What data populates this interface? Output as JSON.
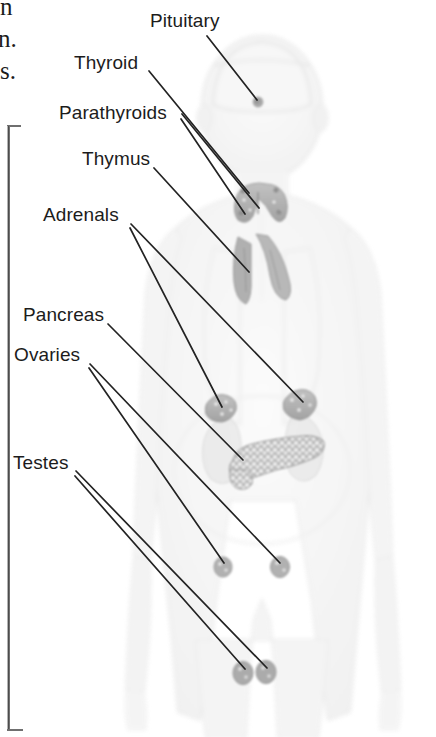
{
  "figure": {
    "type": "labelled-anatomical-diagram",
    "width": 436,
    "height": 737,
    "background_color": "#ffffff",
    "label_color": "#1c1c1c",
    "leader_line_color": "#232323",
    "organ_fill_color": "#b4b4b4",
    "body_silhouette_color": "#f2f2f2"
  },
  "page_text_fragments": [
    {
      "text": "n",
      "x": 0,
      "y": 2
    },
    {
      "text": "n.",
      "x": 0,
      "y": 30
    },
    {
      "text": "s.",
      "x": 2,
      "y": 60
    }
  ],
  "labels": [
    {
      "name": "pituitary",
      "text": "Pituitary",
      "x": 150,
      "y": 11,
      "leader": {
        "x1": 207,
        "y1": 36,
        "x2": 257,
        "y2": 100
      },
      "target": {
        "x": 258,
        "y": 102
      }
    },
    {
      "name": "thyroid",
      "text": "Thyroid",
      "x": 74,
      "y": 53,
      "leader": {
        "x1": 149,
        "y1": 71,
        "x2": 248,
        "y2": 192
      },
      "target": {
        "x": 250,
        "y": 194
      }
    },
    {
      "name": "parathyroids",
      "text": "Parathyroids",
      "x": 59,
      "y": 103,
      "leader": {
        "x1": 182,
        "y1": 115,
        "x2": 258,
        "y2": 209
      },
      "leader2": {
        "x1": 182,
        "y1": 118,
        "x2": 245,
        "y2": 215
      },
      "target": {
        "x": 258,
        "y": 209
      }
    },
    {
      "name": "thymus",
      "text": "Thymus",
      "x": 82,
      "y": 149,
      "leader": {
        "x1": 154,
        "y1": 168,
        "x2": 248,
        "y2": 271
      },
      "target": {
        "x": 250,
        "y": 273
      }
    },
    {
      "name": "adrenals",
      "text": "Adrenals",
      "x": 43,
      "y": 205,
      "leader": {
        "x1": 131,
        "y1": 225,
        "x2": 303,
        "y2": 404
      },
      "leader2": {
        "x1": 131,
        "y1": 227,
        "x2": 222,
        "y2": 409
      },
      "target": {
        "x": 303,
        "y": 404
      }
    },
    {
      "name": "pancreas",
      "text": "Pancreas",
      "x": 23,
      "y": 305,
      "leader": {
        "x1": 108,
        "y1": 324,
        "x2": 242,
        "y2": 459
      },
      "target": {
        "x": 244,
        "y": 461
      }
    },
    {
      "name": "ovaries",
      "text": "Ovaries",
      "x": 14,
      "y": 345,
      "leader": {
        "x1": 90,
        "y1": 365,
        "x2": 279,
        "y2": 564
      },
      "leader2": {
        "x1": 90,
        "y1": 367,
        "x2": 223,
        "y2": 564
      },
      "target": {
        "x": 279,
        "y": 566
      }
    },
    {
      "name": "testes",
      "text": "Testes",
      "x": 13,
      "y": 453,
      "leader": {
        "x1": 76,
        "y1": 472,
        "x2": 266,
        "y2": 669
      },
      "leader2": {
        "x1": 76,
        "y1": 475,
        "x2": 244,
        "y2": 671
      },
      "target": {
        "x": 266,
        "y": 671
      }
    }
  ],
  "organs": [
    {
      "name": "pituitary-gland",
      "shape": "small-round-dot",
      "cx": 258,
      "cy": 102,
      "r": 5
    },
    {
      "name": "thyroid-gland",
      "shape": "butterfly-lobes",
      "cx": 259,
      "cy": 202
    },
    {
      "name": "thymus-gland",
      "shape": "two-lobed-vertical",
      "cx": 249,
      "cy": 265
    },
    {
      "name": "adrenal-gland-left",
      "shape": "cap-on-kidney",
      "cx": 222,
      "cy": 409
    },
    {
      "name": "adrenal-gland-right",
      "shape": "cap-on-kidney",
      "cx": 300,
      "cy": 405
    },
    {
      "name": "kidney-left",
      "shape": "bean",
      "cx": 218,
      "cy": 443
    },
    {
      "name": "kidney-right",
      "shape": "bean",
      "cx": 300,
      "cy": 440
    },
    {
      "name": "pancreas",
      "shape": "stippled-elongated-gland",
      "cx": 270,
      "cy": 455
    },
    {
      "name": "ovary-left",
      "shape": "small-oval",
      "cx": 223,
      "cy": 567
    },
    {
      "name": "ovary-right",
      "shape": "small-oval",
      "cx": 280,
      "cy": 567
    },
    {
      "name": "testis-left",
      "shape": "small-oval",
      "cx": 243,
      "cy": 673
    },
    {
      "name": "testis-right",
      "shape": "small-oval",
      "cx": 266,
      "cy": 672
    }
  ]
}
